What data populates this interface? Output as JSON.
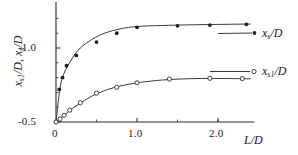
{
  "chart_data": {
    "type": "line",
    "title": "",
    "subtitle": "",
    "xlabel": "L/D",
    "ylabel": "x_s1/D, x_s/D",
    "xlim": [
      -0.06,
      2.45
    ],
    "ylim": [
      -0.46,
      -1.27
    ],
    "grid": false,
    "legend_position": "right-inline",
    "xticks": [
      0,
      1.0,
      2.0
    ],
    "xticklabels": [
      "0",
      "1.0",
      "2.0"
    ],
    "xminorticks": [
      0.5,
      1.5,
      2.0
    ],
    "yticks": [
      -0.5,
      -1.0
    ],
    "yticklabels": [
      "-0.5",
      "-1.0"
    ],
    "yminorticks": [
      -0.6,
      -0.7,
      -0.8,
      -0.9,
      -1.1,
      -1.2
    ],
    "series": [
      {
        "name": "x_s/D",
        "label_main": "x",
        "label_sub": "s",
        "label_tail": "/D",
        "marker": "filled-circle",
        "color": "#262626",
        "x": [
          0.0,
          0.04,
          0.08,
          0.13,
          0.25,
          0.5,
          0.75,
          1.0,
          1.5,
          1.9,
          2.35
        ],
        "y": [
          -0.5,
          -0.72,
          -0.8,
          -0.88,
          -0.95,
          -1.04,
          -1.1,
          -1.14,
          -1.15,
          -1.155,
          -1.16
        ],
        "curve_x": [
          0.0,
          0.05,
          0.1,
          0.2,
          0.3,
          0.45,
          0.6,
          0.8,
          1.0,
          1.3,
          1.7,
          2.1,
          2.4
        ],
        "curve_y": [
          -0.5,
          -0.73,
          -0.83,
          -0.93,
          -1.0,
          -1.06,
          -1.1,
          -1.13,
          -1.145,
          -1.152,
          -1.157,
          -1.16,
          -1.162
        ]
      },
      {
        "name": "x_s1/D",
        "label_main": "x",
        "label_sub": "s1",
        "label_tail": "/D",
        "marker": "open-circle",
        "color": "#333333",
        "x": [
          0.0,
          0.05,
          0.1,
          0.17,
          0.3,
          0.5,
          0.75,
          1.0,
          1.4,
          1.9,
          2.3
        ],
        "y": [
          -0.5,
          -0.52,
          -0.545,
          -0.58,
          -0.63,
          -0.695,
          -0.735,
          -0.765,
          -0.79,
          -0.795,
          -0.793
        ],
        "curve_x": [
          0.0,
          0.1,
          0.2,
          0.35,
          0.5,
          0.7,
          0.9,
          1.1,
          1.4,
          1.8,
          2.2,
          2.4
        ],
        "curve_y": [
          -0.5,
          -0.545,
          -0.59,
          -0.645,
          -0.69,
          -0.73,
          -0.755,
          -0.772,
          -0.787,
          -0.794,
          -0.793,
          -0.792
        ]
      }
    ]
  },
  "axis": {
    "x_label": "L/D",
    "y_label_part1": "x",
    "y_label_sub1": "s1",
    "y_label_mid": "/D, ",
    "y_label_part2": "x",
    "y_label_sub2": "s",
    "y_label_tail": "/D",
    "xtick_0": "0",
    "xtick_1": "1.0",
    "xtick_2": "2.0",
    "ytick_05": "-0.5",
    "ytick_10": "-1.0"
  },
  "legend": {
    "upper_main": "x",
    "upper_sub": "s",
    "upper_tail": "/D",
    "lower_main": "x",
    "lower_sub": "s1",
    "lower_tail": "/D"
  },
  "colors": {
    "axis": "#2b2b2b",
    "curve": "#3a3a3a",
    "marker_filled": "#1f1f1f",
    "marker_open": "#2f2f2f",
    "background": "#ffffff"
  }
}
